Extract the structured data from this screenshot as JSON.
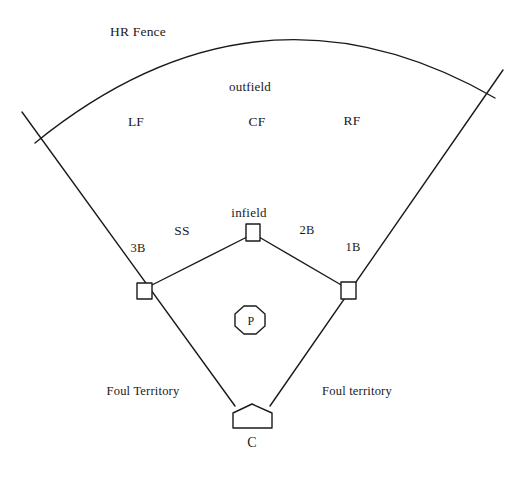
{
  "diagram": {
    "stroke_color": "#1a1a1a",
    "background_color": "#ffffff",
    "labels": {
      "hr_fence": "HR Fence",
      "outfield": "outfield",
      "infield": "infield",
      "left_field": "LF",
      "center_field": "CF",
      "right_field": "RF",
      "shortstop": "SS",
      "second_base": "2B",
      "third_base": "3B",
      "first_base": "1B",
      "pitcher": "P",
      "catcher": "C",
      "foul_territory_left": "Foul Territory",
      "foul_territory_right": "Foul territory"
    },
    "label_positions": {
      "hr_fence": {
        "x": 138,
        "y": 32
      },
      "outfield": {
        "x": 250,
        "y": 86
      },
      "left_field": {
        "x": 136,
        "y": 122
      },
      "center_field": {
        "x": 257,
        "y": 122
      },
      "right_field": {
        "x": 352,
        "y": 121
      },
      "infield": {
        "x": 249,
        "y": 212
      },
      "shortstop": {
        "x": 182,
        "y": 231
      },
      "second_base": {
        "x": 307,
        "y": 230
      },
      "third_base": {
        "x": 138,
        "y": 248
      },
      "first_base": {
        "x": 353,
        "y": 247
      },
      "pitcher": {
        "x": 251,
        "y": 321
      },
      "catcher": {
        "x": 252,
        "y": 443
      },
      "foul_territory_left": {
        "x": 143,
        "y": 391
      },
      "foul_territory_right": {
        "x": 357,
        "y": 391
      }
    },
    "shapes": {
      "home_plate": {
        "cx": 252,
        "cy": 416,
        "width": 39,
        "height": 24
      },
      "first_base": {
        "x": 341,
        "y": 282,
        "width": 15,
        "height": 17
      },
      "second_base": {
        "x": 246,
        "y": 224,
        "width": 14,
        "height": 17
      },
      "third_base": {
        "x": 137,
        "y": 283,
        "width": 15,
        "height": 16
      },
      "pitchers_mound": {
        "cx": 250,
        "cy": 320,
        "radius": 15
      }
    },
    "lines": {
      "foul_line_left": {
        "x1": 235,
        "y1": 406,
        "x2": 22,
        "y2": 112
      },
      "foul_line_right": {
        "x1": 270,
        "y1": 406,
        "x2": 503,
        "y2": 70
      },
      "base_path_third_to_second": {
        "x1": 150,
        "y1": 286,
        "x2": 247,
        "y2": 237
      },
      "base_path_second_to_first": {
        "x1": 259,
        "y1": 237,
        "x2": 343,
        "y2": 286
      },
      "hr_fence_arc": {
        "start": {
          "x": 35,
          "y": 143
        },
        "control": {
          "x": 258,
          "y": -38
        },
        "end": {
          "x": 495,
          "y": 98
        }
      }
    }
  }
}
